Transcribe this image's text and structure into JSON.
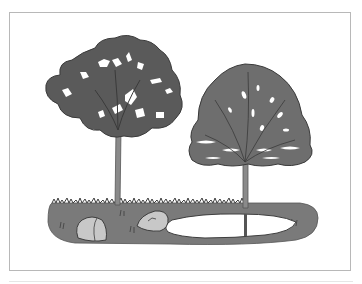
{
  "illustration": {
    "subject": "two deciduous trees beside a small pond with two rocks on grassy ground",
    "colors": {
      "background": "#ffffff",
      "frame_border": "#b8b8b8",
      "canopy_left": "#5a5a5a",
      "canopy_right": "#6e6e6e",
      "canopy_outline": "#3a3a3a",
      "trunk": "#8a8a8a",
      "ground": "#7a7a7a",
      "grass": "#3e3e3e",
      "rock": "#c8c8c8",
      "pond": "#ffffff"
    },
    "elements": [
      {
        "name": "left-tree",
        "type": "broad irregular canopy"
      },
      {
        "name": "right-tree",
        "type": "rounded dome canopy"
      },
      {
        "name": "ground-patch",
        "type": "grassy mound"
      },
      {
        "name": "rock-left",
        "type": "boulder"
      },
      {
        "name": "rock-middle",
        "type": "flat boulder"
      },
      {
        "name": "pond",
        "type": "water"
      }
    ]
  }
}
